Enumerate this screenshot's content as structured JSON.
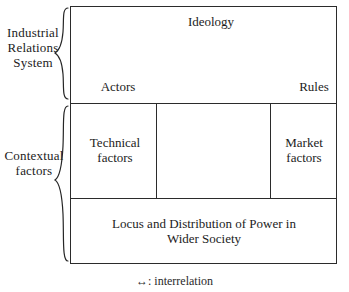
{
  "figure": {
    "left_labels": [
      {
        "id": "industrial-relations-system",
        "text": "Industrial\nRelations\nSystem"
      },
      {
        "id": "contextual-factors",
        "text": "Contextual\nfactors"
      }
    ],
    "boxes": {
      "top": {
        "nodes": [
          {
            "id": "ideology",
            "label": "Ideology"
          },
          {
            "id": "actors",
            "label": "Actors"
          },
          {
            "id": "rules",
            "label": "Rules"
          }
        ]
      },
      "middle": {
        "left_cell": "Technical\nfactors",
        "right_cell": "Market\nfactors",
        "center_cell": "interrelation-diamond"
      },
      "bottom": {
        "label": "Locus and Distribution of Power in\nWider Society"
      }
    },
    "caption": "↔: interrelation",
    "colors": {
      "line": "#2b2b2b",
      "arrow": "#2f2f2f",
      "text": "#1c1c1c",
      "background": "#ffffff"
    },
    "braces": {
      "top": "{",
      "bottom": "{"
    }
  }
}
